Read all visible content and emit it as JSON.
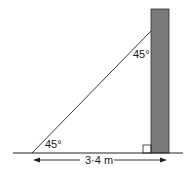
{
  "diagram": {
    "angle_top": "45°",
    "angle_bottom": "45°",
    "distance": "3·4 m",
    "colors": {
      "wall": "#7a7a7a",
      "line": "#222222"
    }
  }
}
